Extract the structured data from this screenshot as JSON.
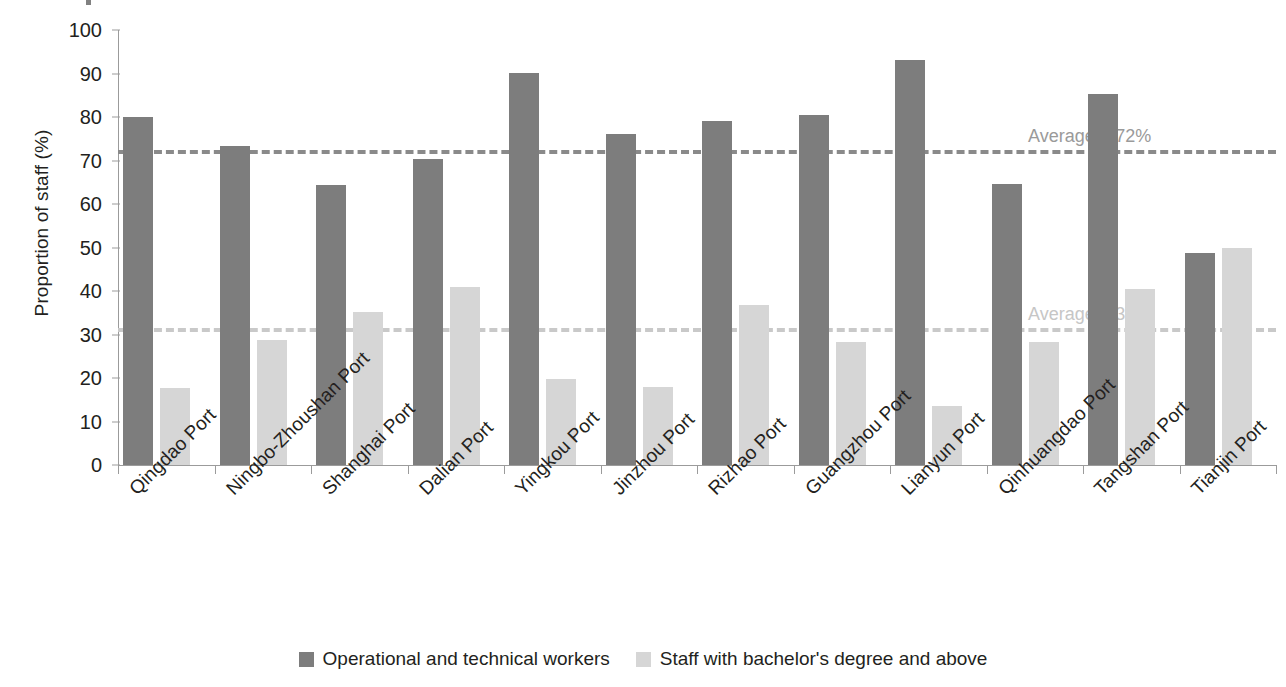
{
  "chart_data": {
    "type": "bar",
    "title": "",
    "xlabel": "",
    "ylabel": "Proportion of staff (%)",
    "ylim": [
      0,
      100
    ],
    "ytick_step": 10,
    "yticks": [
      0,
      10,
      20,
      30,
      40,
      50,
      60,
      70,
      80,
      90,
      100
    ],
    "grid": false,
    "legend_position": "bottom-center",
    "categories": [
      "Qingdao Port",
      "Ningbo-Zhoushan Port",
      "Shanghai Port",
      "Dalian Port",
      "Yingkou Port",
      "Jinzhou Port",
      "Rizhao Port",
      "Guangzhou Port",
      "Lianyun Port",
      "Qinhuangdao Port",
      "Tangshan Port",
      "Tianjin Port"
    ],
    "series": [
      {
        "name": "Operational and technical workers",
        "color": "#7d7d7d",
        "values": [
          80.0,
          73.4,
          64.3,
          70.3,
          90.2,
          76.0,
          79.0,
          80.4,
          93.0,
          64.6,
          85.2,
          48.8
        ]
      },
      {
        "name": "Staff with bachelor's degree and above",
        "color": "#d6d6d6",
        "values": [
          17.6,
          28.7,
          35.2,
          41.0,
          19.8,
          17.9,
          36.7,
          28.3,
          13.6,
          28.3,
          40.5,
          49.9
        ]
      }
    ],
    "annotations": [
      {
        "label": "Average = 72%",
        "value": 72,
        "series": "Operational and technical workers",
        "color": "#9a9a9a"
      },
      {
        "label": "Average = 31%",
        "value": 31,
        "series": "Staff with bachelor's degree and above",
        "color": "#c6c6c6"
      }
    ]
  },
  "legend": {
    "items": [
      {
        "label": "Operational and technical workers",
        "swatch": "dark"
      },
      {
        "label": "Staff with bachelor's degree and above",
        "swatch": "light"
      }
    ]
  }
}
